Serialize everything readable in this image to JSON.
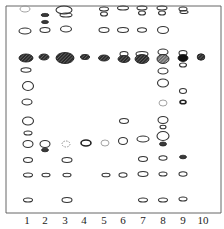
{
  "figure": {
    "type": "thin-layer chromatogram",
    "lanes": [
      {
        "label": "1",
        "x": 27
      },
      {
        "label": "2",
        "x": 45
      },
      {
        "label": "3",
        "x": 65
      },
      {
        "label": "4",
        "x": 84
      },
      {
        "label": "5",
        "x": 104
      },
      {
        "label": "6",
        "x": 123
      },
      {
        "label": "7",
        "x": 143
      },
      {
        "label": "8",
        "x": 163
      },
      {
        "label": "9",
        "x": 183
      },
      {
        "label": "10",
        "x": 203
      }
    ],
    "spots": [
      {
        "lane": "1",
        "x": 25,
        "y": 9,
        "rx": 5,
        "ry": 3,
        "style": "faint"
      },
      {
        "lane": "1",
        "x": 25,
        "y": 31,
        "rx": 6,
        "ry": 3,
        "style": "outline"
      },
      {
        "lane": "1",
        "x": 26,
        "y": 58,
        "rx": 7,
        "ry": 4,
        "style": "dark-hatched"
      },
      {
        "lane": "1",
        "x": 26,
        "y": 70,
        "rx": 5,
        "ry": 2.2,
        "style": "outline"
      },
      {
        "lane": "1",
        "x": 28,
        "y": 86,
        "rx": 5.5,
        "ry": 4.5,
        "style": "outline"
      },
      {
        "lane": "1",
        "x": 27,
        "y": 102,
        "rx": 5,
        "ry": 3,
        "style": "outline"
      },
      {
        "lane": "1",
        "x": 28,
        "y": 121,
        "rx": 5.5,
        "ry": 4,
        "style": "outline"
      },
      {
        "lane": "1",
        "x": 28,
        "y": 133,
        "rx": 4,
        "ry": 2,
        "style": "outline"
      },
      {
        "lane": "1",
        "x": 28,
        "y": 144,
        "rx": 5,
        "ry": 3.5,
        "style": "outline"
      },
      {
        "lane": "1",
        "x": 28,
        "y": 160,
        "rx": 4.5,
        "ry": 2.5,
        "style": "outline"
      },
      {
        "lane": "1",
        "x": 28,
        "y": 175,
        "rx": 4.5,
        "ry": 2,
        "style": "outline"
      },
      {
        "lane": "1",
        "x": 28,
        "y": 200,
        "rx": 4.5,
        "ry": 2,
        "style": "outline"
      },
      {
        "lane": "2",
        "x": 45,
        "y": 15,
        "rx": 4,
        "ry": 1.6,
        "style": "dark"
      },
      {
        "lane": "2",
        "x": 45,
        "y": 22,
        "rx": 3.5,
        "ry": 1.6,
        "style": "dark"
      },
      {
        "lane": "2",
        "x": 45,
        "y": 30,
        "rx": 5,
        "ry": 2.5,
        "style": "outline"
      },
      {
        "lane": "2",
        "x": 44,
        "y": 57,
        "rx": 5,
        "ry": 3,
        "style": "dark-hatched"
      },
      {
        "lane": "2",
        "x": 45,
        "y": 144,
        "rx": 5,
        "ry": 3.5,
        "style": "outline"
      },
      {
        "lane": "2",
        "x": 45,
        "y": 150,
        "rx": 3.5,
        "ry": 1.8,
        "style": "dark"
      },
      {
        "lane": "2",
        "x": 46,
        "y": 175,
        "rx": 4,
        "ry": 1.8,
        "style": "outline"
      },
      {
        "lane": "3",
        "x": 64,
        "y": 10,
        "rx": 8,
        "ry": 4,
        "style": "outline"
      },
      {
        "lane": "3",
        "x": 66,
        "y": 15,
        "rx": 6,
        "ry": 2,
        "style": "outline"
      },
      {
        "lane": "3",
        "x": 66,
        "y": 29,
        "rx": 5.5,
        "ry": 3,
        "style": "outline"
      },
      {
        "lane": "3",
        "x": 65,
        "y": 58,
        "rx": 9,
        "ry": 5.5,
        "style": "dark-hatched"
      },
      {
        "lane": "3",
        "x": 66,
        "y": 144,
        "rx": 4,
        "ry": 3,
        "style": "dashed"
      },
      {
        "lane": "3",
        "x": 67,
        "y": 160,
        "rx": 5,
        "ry": 2.5,
        "style": "outline"
      },
      {
        "lane": "3",
        "x": 67,
        "y": 175,
        "rx": 4,
        "ry": 1.8,
        "style": "outline"
      },
      {
        "lane": "3",
        "x": 67,
        "y": 200,
        "rx": 5,
        "ry": 2.5,
        "style": "outline"
      },
      {
        "lane": "4",
        "x": 85,
        "y": 57,
        "rx": 4.5,
        "ry": 2.5,
        "style": "dark-hatched"
      },
      {
        "lane": "4",
        "x": 86,
        "y": 143,
        "rx": 5,
        "ry": 3,
        "style": "outline-heavy"
      },
      {
        "lane": "5",
        "x": 104,
        "y": 9,
        "rx": 4.5,
        "ry": 2,
        "style": "outline"
      },
      {
        "lane": "5",
        "x": 104,
        "y": 14,
        "rx": 3.5,
        "ry": 2,
        "style": "outline"
      },
      {
        "lane": "5",
        "x": 104,
        "y": 30,
        "rx": 5,
        "ry": 2.5,
        "style": "outline"
      },
      {
        "lane": "5",
        "x": 104,
        "y": 58,
        "rx": 5.5,
        "ry": 3,
        "style": "dark-hatched"
      },
      {
        "lane": "5",
        "x": 105,
        "y": 143,
        "rx": 4,
        "ry": 3,
        "style": "faint"
      },
      {
        "lane": "5",
        "x": 106,
        "y": 175,
        "rx": 4,
        "ry": 1.8,
        "style": "outline"
      },
      {
        "lane": "6",
        "x": 123,
        "y": 8,
        "rx": 5.5,
        "ry": 2,
        "style": "outline"
      },
      {
        "lane": "6",
        "x": 123,
        "y": 30,
        "rx": 5.5,
        "ry": 2.5,
        "style": "outline"
      },
      {
        "lane": "6",
        "x": 124,
        "y": 54,
        "rx": 4,
        "ry": 2.5,
        "style": "outline"
      },
      {
        "lane": "6",
        "x": 124,
        "y": 59,
        "rx": 6,
        "ry": 3.5,
        "style": "dark-hatched"
      },
      {
        "lane": "6",
        "x": 124,
        "y": 121,
        "rx": 4.5,
        "ry": 2.5,
        "style": "outline"
      },
      {
        "lane": "6",
        "x": 123,
        "y": 141,
        "rx": 4.5,
        "ry": 3.5,
        "style": "outline"
      },
      {
        "lane": "6",
        "x": 123,
        "y": 175,
        "rx": 4,
        "ry": 2.2,
        "style": "outline"
      },
      {
        "lane": "7",
        "x": 142,
        "y": 8,
        "rx": 5,
        "ry": 2,
        "style": "outline"
      },
      {
        "lane": "7",
        "x": 142,
        "y": 13,
        "rx": 3.5,
        "ry": 2,
        "style": "outline"
      },
      {
        "lane": "7",
        "x": 142,
        "y": 30,
        "rx": 4.5,
        "ry": 2.2,
        "style": "outline"
      },
      {
        "lane": "7",
        "x": 142,
        "y": 54,
        "rx": 6,
        "ry": 2.5,
        "style": "outline"
      },
      {
        "lane": "7",
        "x": 142,
        "y": 59,
        "rx": 7,
        "ry": 4.5,
        "style": "dark-hatched"
      },
      {
        "lane": "7",
        "x": 143,
        "y": 139,
        "rx": 6,
        "ry": 3,
        "style": "outline"
      },
      {
        "lane": "7",
        "x": 143,
        "y": 159,
        "rx": 4.5,
        "ry": 2.5,
        "style": "outline"
      },
      {
        "lane": "7",
        "x": 143,
        "y": 174,
        "rx": 5,
        "ry": 2.5,
        "style": "outline"
      },
      {
        "lane": "7",
        "x": 143,
        "y": 200,
        "rx": 4.5,
        "ry": 2,
        "style": "outline"
      },
      {
        "lane": "8",
        "x": 162,
        "y": 8,
        "rx": 5,
        "ry": 2,
        "style": "outline"
      },
      {
        "lane": "8",
        "x": 162,
        "y": 13,
        "rx": 3.5,
        "ry": 2,
        "style": "outline"
      },
      {
        "lane": "8",
        "x": 163,
        "y": 30,
        "rx": 5.5,
        "ry": 3.5,
        "style": "outline"
      },
      {
        "lane": "8",
        "x": 163,
        "y": 52,
        "rx": 5,
        "ry": 3,
        "style": "outline"
      },
      {
        "lane": "8",
        "x": 163,
        "y": 59,
        "rx": 6,
        "ry": 4.5,
        "style": "light-hatched"
      },
      {
        "lane": "8",
        "x": 163,
        "y": 71,
        "rx": 5,
        "ry": 3,
        "style": "outline"
      },
      {
        "lane": "8",
        "x": 163,
        "y": 83,
        "rx": 5.5,
        "ry": 4,
        "style": "outline"
      },
      {
        "lane": "8",
        "x": 163,
        "y": 103,
        "rx": 4,
        "ry": 3,
        "style": "faint"
      },
      {
        "lane": "8",
        "x": 163,
        "y": 120,
        "rx": 5,
        "ry": 3.5,
        "style": "outline"
      },
      {
        "lane": "8",
        "x": 163,
        "y": 127,
        "rx": 3,
        "ry": 1.8,
        "style": "outline"
      },
      {
        "lane": "8",
        "x": 163,
        "y": 136,
        "rx": 6,
        "ry": 4.5,
        "style": "outline"
      },
      {
        "lane": "8",
        "x": 163,
        "y": 144,
        "rx": 3.5,
        "ry": 2,
        "style": "dark"
      },
      {
        "lane": "8",
        "x": 163,
        "y": 158,
        "rx": 4,
        "ry": 2.2,
        "style": "outline"
      },
      {
        "lane": "8",
        "x": 163,
        "y": 174,
        "rx": 4,
        "ry": 2,
        "style": "outline"
      },
      {
        "lane": "8",
        "x": 163,
        "y": 200,
        "rx": 4.5,
        "ry": 2,
        "style": "outline"
      },
      {
        "lane": "9",
        "x": 183,
        "y": 9,
        "rx": 4,
        "ry": 2,
        "style": "outline"
      },
      {
        "lane": "9",
        "x": 184,
        "y": 12,
        "rx": 4,
        "ry": 1.5,
        "style": "outline"
      },
      {
        "lane": "9",
        "x": 183,
        "y": 53,
        "rx": 4,
        "ry": 2.5,
        "style": "outline"
      },
      {
        "lane": "9",
        "x": 183,
        "y": 58,
        "rx": 5,
        "ry": 3.5,
        "style": "black"
      },
      {
        "lane": "9",
        "x": 183,
        "y": 65,
        "rx": 3.5,
        "ry": 2,
        "style": "outline"
      },
      {
        "lane": "9",
        "x": 183,
        "y": 91,
        "rx": 3.5,
        "ry": 2.5,
        "style": "outline"
      },
      {
        "lane": "9",
        "x": 183,
        "y": 102,
        "rx": 3,
        "ry": 1.8,
        "style": "outline-heavy"
      },
      {
        "lane": "9",
        "x": 183,
        "y": 157,
        "rx": 3.5,
        "ry": 1.8,
        "style": "dark"
      },
      {
        "lane": "9",
        "x": 183,
        "y": 174,
        "rx": 4,
        "ry": 2.2,
        "style": "outline"
      },
      {
        "lane": "9",
        "x": 183,
        "y": 199,
        "rx": 4,
        "ry": 2,
        "style": "outline"
      },
      {
        "lane": "10",
        "x": 201,
        "y": 57,
        "rx": 3.8,
        "ry": 3.2,
        "style": "dark-hatched"
      }
    ],
    "frame": {
      "left": 6,
      "top": 6,
      "right": 221,
      "bottom": 213
    }
  }
}
